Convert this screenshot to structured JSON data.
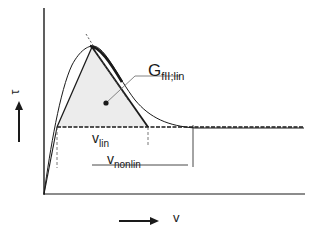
{
  "figure": {
    "type": "traction-separation diagram",
    "axes": {
      "y_label": "τ",
      "x_label": "v"
    },
    "annotations": {
      "energy_label_main": "G",
      "energy_label_sub": "fII;lin",
      "v_lin_main": "v",
      "v_lin_sub": "lin",
      "v_nonlin_main": "v",
      "v_nonlin_sub": "nonlin"
    },
    "curves": [
      {
        "name": "nonlinear-curve",
        "style": "solid thin smooth"
      },
      {
        "name": "linear-triangle",
        "style": "solid with shaded interior"
      },
      {
        "name": "residual-plateau",
        "style": "dashed horizontal"
      },
      {
        "name": "tangent-extension",
        "style": "dashed"
      }
    ],
    "colors": {
      "ink": "#1a1a1a",
      "shade": "#e4e4e4",
      "background": "#ffffff"
    }
  }
}
